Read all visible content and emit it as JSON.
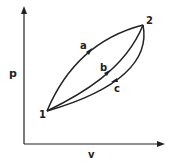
{
  "diagram": {
    "axes": {
      "y_label": "p",
      "x_label": "v"
    },
    "states": [
      {
        "label": "1",
        "x": 47,
        "y": 111
      },
      {
        "label": "2",
        "x": 143,
        "y": 25
      }
    ],
    "paths": [
      {
        "label": "a",
        "from": "1",
        "to": "2",
        "shape": "concave up-left arc",
        "direction": "1 to 2"
      },
      {
        "label": "b",
        "from": "1",
        "to": "2",
        "shape": "near straight",
        "direction": "1 to 2"
      },
      {
        "label": "c",
        "from": "2",
        "to": "1",
        "shape": "lower arc",
        "direction": "2 to 1"
      }
    ],
    "colors": {
      "ink": "#222222",
      "background": "#ffffff"
    }
  }
}
